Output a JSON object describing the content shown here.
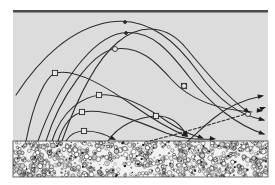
{
  "figure": {
    "type": "scientific-diagram",
    "width": 275,
    "height": 185
  },
  "colors": {
    "background": "#ffffff",
    "medium_fill": "#dcdcdc",
    "bed_fill": "#f2f2f2",
    "grain_dark": "#1c1c1c",
    "grain_mid": "#6e6e6e",
    "grain_light": "#ffffff",
    "stroke": "#2b2b2b",
    "top_border": "#4a4a4a",
    "marker_fill": "#e8e8e8"
  },
  "panel": {
    "name": "medium-panel",
    "x": 13,
    "y": 10,
    "width": 255,
    "height": 131,
    "top_border_thickness": 2.5
  },
  "bed": {
    "name": "granular-bed",
    "label": "granular bed",
    "x": 13,
    "y": 141,
    "width": 255,
    "height": 36,
    "grain_count": 760
  },
  "chart_data": {
    "type": "line",
    "xlabel": "",
    "ylabel": "",
    "grid": false,
    "legend": null,
    "xlim": [
      13,
      268
    ],
    "ylim": [
      10,
      141
    ],
    "series": [
      {
        "name": "trajectory-1",
        "marker": "apex-marker",
        "apex": [
          125,
          22
        ],
        "end_style": "arrow-right-edge",
        "path": "M 16,95 C 40,58 72,28 110,22 C 150,16 178,44 198,72 C 218,100 240,116 264,120",
        "markers": [
          [
            125,
            22
          ]
        ],
        "arrow": {
          "x": 265,
          "y": 120.5,
          "angle": 16
        }
      },
      {
        "name": "trajectory-2",
        "marker": "apex-marker",
        "apex": [
          126,
          33
        ],
        "end_style": "arrow-right-edge",
        "path": "M 38,141 C 58,84 92,38 122,33 C 152,29 170,52 190,78 C 210,104 238,126 264,134",
        "markers": [
          [
            126,
            33
          ]
        ],
        "arrow": {
          "x": 265,
          "y": 134.5,
          "angle": 20
        }
      },
      {
        "name": "trajectory-3",
        "marker": "apex-marker",
        "apex": [
          115,
          49
        ],
        "end_style": "arrow-right-edge",
        "path": "M 46,141 C 60,96 92,53 114,49 C 140,45 156,62 172,80 C 192,102 222,110 252,112",
        "markers": [
          [
            115,
            49
          ],
          [
            184,
            86
          ]
        ],
        "arrow": {
          "x": 263,
          "y": 111,
          "angle": 6
        }
      },
      {
        "name": "trajectory-4",
        "marker": "apex-marker",
        "apex": [
          55,
          73
        ],
        "end_style": "arrow-bed-impact",
        "path": "M 26,141 C 34,100 46,76 56,73 C 76,68 108,88 134,106 C 154,120 172,130 186,136",
        "markers": [
          [
            55,
            73
          ]
        ],
        "arrow": {
          "x": 188,
          "y": 137,
          "angle": 30
        }
      },
      {
        "name": "trajectory-5",
        "marker": "apex-marker",
        "apex": [
          99,
          95
        ],
        "end_style": "arrow-bed-impact",
        "path": "M 52,141 C 62,110 82,97 100,95 C 122,93 148,108 168,122 C 182,131 194,136 202,138",
        "markers": [
          [
            99,
            95
          ]
        ],
        "arrow": {
          "x": 204,
          "y": 138.5,
          "angle": 20
        }
      },
      {
        "name": "trajectory-6",
        "marker": "apex-marker",
        "apex": [
          82,
          112
        ],
        "end_style": "arrow-bed-impact",
        "path": "M 58,141 C 64,122 72,114 83,112 C 106,108 140,122 166,133 C 180,138 192,140 214,139",
        "markers": [
          [
            82,
            112
          ]
        ],
        "arrow": {
          "x": 216,
          "y": 139,
          "angle": 6
        }
      },
      {
        "name": "trajectory-7",
        "marker": "apex-marker",
        "apex": [
          84,
          131
        ],
        "end_style": "arrow-bed-impact",
        "path": "M 66,141 C 70,134 76,131 85,131 C 98,131 106,135 114,139",
        "markers": [
          [
            84,
            131
          ]
        ],
        "arrow": {
          "x": 116,
          "y": 140,
          "angle": 25
        }
      },
      {
        "name": "trajectory-8",
        "marker": "apex-marker",
        "apex": [
          156,
          116
        ],
        "end_style": "arrow-bed-impact",
        "path": "M 108,141 C 118,126 136,117 157,116 C 172,116 180,124 186,134",
        "markers": [
          [
            156,
            116
          ]
        ],
        "arrow": {
          "x": 188,
          "y": 137,
          "angle": 60
        }
      },
      {
        "name": "trajectory-9",
        "marker": "descending-marker",
        "apex": [
          184,
          86
        ],
        "end_style": "arrow-right-edge",
        "path": "M 62,141 C 78,96 96,60 118,42 C 142,22 168,26 186,48 C 206,72 226,96 248,112",
        "markers": [
          [
            184,
            86
          ]
        ],
        "arrow": {
          "x": 250,
          "y": 113,
          "angle": 35
        }
      },
      {
        "name": "trajectory-10",
        "marker": "descending-marker",
        "apex": [
          248,
          114
        ],
        "end_style": "arrow-dashed-exit",
        "path": "M 150,141 C 178,134 212,124 246,114",
        "markers": [
          [
            248,
            114
          ]
        ],
        "arrow": {
          "x": 266,
          "y": 107,
          "angle": -20
        }
      },
      {
        "name": "trajectory-11",
        "marker": "none",
        "apex": [
          208,
          139
        ],
        "end_style": "arrow-bed-impact",
        "path": "M 188,141 C 196,134 204,126 214,118 C 226,108 242,100 262,96",
        "markers": [],
        "arrow": {
          "x": 264,
          "y": 95.5,
          "angle": -12
        }
      }
    ]
  },
  "elements": {
    "top_border_name": "top-boundary-line",
    "medium_name": "air-medium-region",
    "bed_name": "granular-bed-region",
    "trajectory_group_name": "trajectory-paths"
  }
}
